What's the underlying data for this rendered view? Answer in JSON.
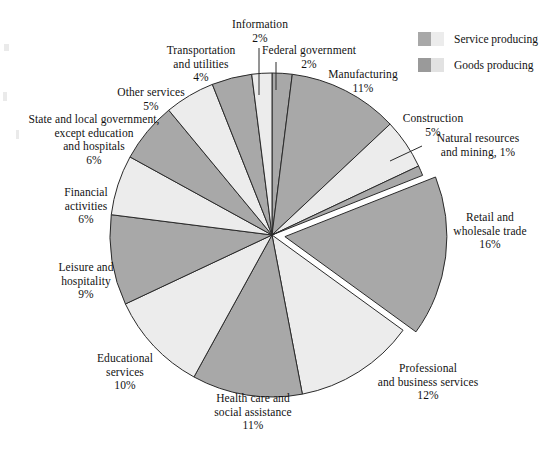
{
  "legend": {
    "items": [
      {
        "label": "Service producing",
        "color_dark": "#a8a8a8",
        "color_light": "#ececec",
        "category": "service"
      },
      {
        "label": "Goods producing",
        "color_dark": "#9a9a9a",
        "color_light": "#e2e2e2",
        "category": "goods"
      }
    ]
  },
  "colors": {
    "slice_dark": "#a8a8a8",
    "slice_light": "#ececec",
    "outline": "#2a2a2a",
    "background": "#ffffff",
    "text": "#121212"
  },
  "chart_data": {
    "type": "pie",
    "title": "",
    "total_percent": 100,
    "start_angle_deg": 0,
    "direction": "clockwise",
    "legend_position": "top-right",
    "categories": [
      "Federal government",
      "Manufacturing",
      "Construction",
      "Natural resources and mining",
      "Retail and wholesale trade",
      "Professional and business services",
      "Health care and social assistance",
      "Educational services",
      "Leisure and hospitality",
      "Financial activities",
      "State and local government, except education and hospitals",
      "Other services",
      "Transportation and utilities",
      "Information"
    ],
    "values": [
      2,
      11,
      5,
      1,
      16,
      12,
      11,
      10,
      9,
      6,
      6,
      5,
      4,
      2
    ],
    "slices": [
      {
        "name": "Federal government",
        "value": 2,
        "display": "2%",
        "fill": "dark",
        "group": "service",
        "exploded": false
      },
      {
        "name": "Manufacturing",
        "value": 11,
        "display": "11%",
        "fill": "dark",
        "group": "goods",
        "exploded": false
      },
      {
        "name": "Construction",
        "value": 5,
        "display": "5%",
        "fill": "light",
        "group": "goods",
        "exploded": false
      },
      {
        "name": "Natural resources and mining",
        "value": 1,
        "display": "1%",
        "fill": "dark",
        "group": "goods",
        "exploded": false
      },
      {
        "name": "Retail and wholesale trade",
        "value": 16,
        "display": "16%",
        "fill": "dark",
        "group": "service",
        "exploded": true
      },
      {
        "name": "Professional and business services",
        "value": 12,
        "display": "12%",
        "fill": "light",
        "group": "service",
        "exploded": false
      },
      {
        "name": "Health care and social assistance",
        "value": 11,
        "display": "11%",
        "fill": "dark",
        "group": "service",
        "exploded": false
      },
      {
        "name": "Educational services",
        "value": 10,
        "display": "10%",
        "fill": "light",
        "group": "service",
        "exploded": false
      },
      {
        "name": "Leisure and hospitality",
        "value": 9,
        "display": "9%",
        "fill": "dark",
        "group": "service",
        "exploded": false
      },
      {
        "name": "Financial activities",
        "value": 6,
        "display": "6%",
        "fill": "light",
        "group": "service",
        "exploded": false
      },
      {
        "name": "State and local government, except education and hospitals",
        "value": 6,
        "display": "6%",
        "fill": "dark",
        "group": "service",
        "exploded": false
      },
      {
        "name": "Other services",
        "value": 5,
        "display": "5%",
        "fill": "light",
        "group": "service",
        "exploded": false
      },
      {
        "name": "Transportation and utilities",
        "value": 4,
        "display": "4%",
        "fill": "dark",
        "group": "service",
        "exploded": false
      },
      {
        "name": "Information",
        "value": 2,
        "display": "2%",
        "fill": "light",
        "group": "service",
        "exploded": false
      }
    ]
  },
  "labels": {
    "information": "Information\n2%",
    "federal_government": "Federal government\n2%",
    "transportation_utilities": "Transportation\nand utilities\n4%",
    "other_services": "Other services\n5%",
    "state_local_government": "State and local government,\nexcept education\nand hospitals\n6%",
    "financial_activities": "Financial\nactivities\n6%",
    "leisure_hospitality": "Leisure and\nhospitality\n9%",
    "educational_services": "Educational\nservices\n10%",
    "health_care": "Health care and\nsocial assistance\n11%",
    "professional_business": "Professional\nand business services\n12%",
    "retail_wholesale": "Retail and\nwholesale trade\n16%",
    "natural_resources": "Natural resources\nand mining, 1%",
    "construction": "Construction\n5%",
    "manufacturing": "Manufacturing\n11%"
  }
}
